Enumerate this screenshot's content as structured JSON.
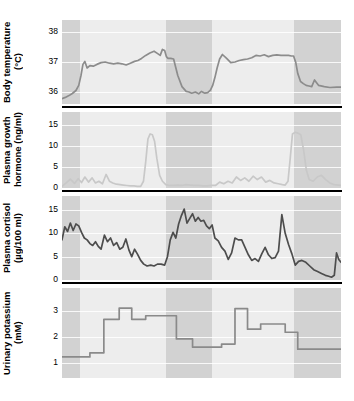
{
  "figure": {
    "top_annotations": [
      {
        "label": "Lights on",
        "x_frac": 0.13
      },
      {
        "label": "Lights off",
        "x_frac": 0.385
      }
    ]
  },
  "chart_data": [
    {
      "type": "line",
      "title": "Body temperature",
      "ylabel": "Body temperature (°C)",
      "units": "°C",
      "xlabel": "",
      "ylim": [
        35.6,
        38.4
      ],
      "yticks": [
        38,
        37,
        36
      ],
      "grid": true,
      "line_color": "#8c8c8c",
      "shaded_bands": [
        {
          "label": "dark",
          "x0": 0.0,
          "x1": 0.065
        },
        {
          "label": "light",
          "x0": 0.065,
          "x1": 0.372
        },
        {
          "label": "dark",
          "x0": 0.372,
          "x1": 0.537
        },
        {
          "label": "light",
          "x0": 0.537,
          "x1": 0.83
        },
        {
          "label": "dark",
          "x0": 0.83,
          "x1": 1.0
        }
      ],
      "x": [
        0.0,
        0.012,
        0.025,
        0.037,
        0.05,
        0.06,
        0.068,
        0.075,
        0.082,
        0.09,
        0.1,
        0.112,
        0.125,
        0.14,
        0.155,
        0.17,
        0.185,
        0.2,
        0.215,
        0.23,
        0.245,
        0.26,
        0.272,
        0.285,
        0.3,
        0.315,
        0.33,
        0.343,
        0.352,
        0.36,
        0.368,
        0.374,
        0.38,
        0.39,
        0.4,
        0.415,
        0.43,
        0.445,
        0.455,
        0.465,
        0.478,
        0.49,
        0.5,
        0.512,
        0.522,
        0.532,
        0.54,
        0.548,
        0.556,
        0.565,
        0.575,
        0.59,
        0.605,
        0.62,
        0.635,
        0.65,
        0.665,
        0.68,
        0.695,
        0.71,
        0.725,
        0.74,
        0.755,
        0.77,
        0.785,
        0.8,
        0.812,
        0.822,
        0.83,
        0.838,
        0.845,
        0.855,
        0.865,
        0.875,
        0.885,
        0.895,
        0.905,
        0.92,
        0.94,
        0.96,
        0.985,
        1.0
      ],
      "y": [
        35.78,
        35.82,
        35.88,
        35.95,
        36.05,
        36.22,
        36.55,
        36.92,
        37.02,
        36.8,
        36.88,
        36.86,
        36.92,
        36.98,
        37.0,
        36.96,
        36.94,
        36.96,
        36.94,
        36.9,
        36.96,
        37.02,
        37.05,
        37.12,
        37.22,
        37.3,
        37.36,
        37.28,
        37.22,
        37.42,
        37.38,
        37.18,
        37.12,
        37.12,
        37.1,
        36.55,
        36.18,
        36.02,
        36.0,
        35.96,
        36.0,
        35.94,
        36.02,
        35.96,
        35.98,
        36.06,
        36.22,
        36.48,
        36.8,
        37.1,
        37.25,
        37.12,
        36.98,
        37.0,
        37.05,
        37.08,
        37.1,
        37.14,
        37.22,
        37.2,
        37.24,
        37.18,
        37.22,
        37.24,
        37.22,
        37.22,
        37.22,
        37.2,
        37.2,
        36.98,
        36.62,
        36.35,
        36.28,
        36.22,
        36.2,
        36.18,
        36.4,
        36.22,
        36.18,
        36.15,
        36.16,
        36.16
      ]
    },
    {
      "type": "line",
      "title": "Plasma growth hormone",
      "ylabel": "Plasma growth hormone (ng/ml)",
      "units": "ng/ml",
      "xlabel": "",
      "ylim": [
        0,
        18
      ],
      "yticks": [
        15,
        10,
        5,
        0
      ],
      "grid": true,
      "line_color": "#c8c8c8",
      "shaded_bands": [
        {
          "label": "dark",
          "x0": 0.0,
          "x1": 0.065
        },
        {
          "label": "light",
          "x0": 0.065,
          "x1": 0.372
        },
        {
          "label": "dark",
          "x0": 0.372,
          "x1": 0.537
        },
        {
          "label": "light",
          "x0": 0.537,
          "x1": 0.83
        },
        {
          "label": "dark",
          "x0": 0.83,
          "x1": 1.0
        }
      ],
      "x": [
        0.0,
        0.015,
        0.03,
        0.045,
        0.058,
        0.07,
        0.082,
        0.095,
        0.108,
        0.12,
        0.132,
        0.145,
        0.158,
        0.17,
        0.182,
        0.195,
        0.208,
        0.22,
        0.232,
        0.245,
        0.258,
        0.27,
        0.282,
        0.292,
        0.3,
        0.308,
        0.316,
        0.324,
        0.332,
        0.34,
        0.35,
        0.36,
        0.372,
        0.385,
        0.4,
        0.415,
        0.43,
        0.445,
        0.46,
        0.475,
        0.49,
        0.505,
        0.52,
        0.535,
        0.55,
        0.565,
        0.58,
        0.595,
        0.61,
        0.625,
        0.64,
        0.655,
        0.67,
        0.685,
        0.7,
        0.715,
        0.73,
        0.745,
        0.76,
        0.775,
        0.79,
        0.8,
        0.81,
        0.818,
        0.826,
        0.836,
        0.846,
        0.856,
        0.866,
        0.876,
        0.886,
        0.9,
        0.915,
        0.93,
        0.945,
        0.96,
        0.975,
        1.0
      ],
      "y": [
        0.4,
        1.2,
        2.1,
        1.1,
        2.2,
        1.3,
        2.6,
        1.4,
        2.4,
        1.2,
        1.6,
        1.0,
        3.2,
        1.6,
        1.2,
        0.9,
        0.8,
        0.7,
        0.6,
        0.5,
        0.5,
        0.4,
        0.4,
        1.6,
        6.2,
        11.6,
        12.8,
        12.6,
        11.0,
        7.0,
        3.0,
        1.6,
        0.8,
        0.6,
        0.6,
        0.7,
        0.6,
        0.8,
        0.7,
        0.6,
        0.6,
        0.5,
        0.5,
        0.6,
        0.6,
        1.4,
        1.0,
        1.6,
        1.2,
        2.6,
        1.8,
        2.4,
        1.6,
        2.8,
        2.0,
        2.6,
        1.4,
        1.8,
        1.2,
        1.0,
        0.8,
        0.7,
        1.6,
        7.0,
        12.8,
        13.2,
        13.0,
        12.6,
        9.0,
        4.2,
        2.0,
        1.6,
        2.6,
        3.0,
        2.0,
        1.2,
        0.8,
        0.6
      ]
    },
    {
      "type": "line",
      "title": "Plasma cortisol",
      "ylabel": "Plasma cortisol (µg/100 ml)",
      "units": "µg/100 ml",
      "xlabel": "",
      "ylim": [
        0,
        18
      ],
      "yticks": [
        15,
        10,
        5,
        0
      ],
      "grid": true,
      "line_color": "#4d4d4d",
      "shaded_bands": [
        {
          "label": "dark",
          "x0": 0.0,
          "x1": 0.065
        },
        {
          "label": "light",
          "x0": 0.065,
          "x1": 0.372
        },
        {
          "label": "dark",
          "x0": 0.372,
          "x1": 0.537
        },
        {
          "label": "light",
          "x0": 0.537,
          "x1": 0.83
        },
        {
          "label": "dark",
          "x0": 0.83,
          "x1": 1.0
        }
      ],
      "x": [
        0.0,
        0.01,
        0.02,
        0.03,
        0.04,
        0.05,
        0.06,
        0.07,
        0.08,
        0.09,
        0.1,
        0.11,
        0.12,
        0.13,
        0.14,
        0.152,
        0.163,
        0.174,
        0.185,
        0.196,
        0.207,
        0.218,
        0.229,
        0.24,
        0.25,
        0.26,
        0.27,
        0.282,
        0.293,
        0.305,
        0.318,
        0.33,
        0.342,
        0.355,
        0.368,
        0.378,
        0.388,
        0.398,
        0.408,
        0.418,
        0.428,
        0.438,
        0.448,
        0.458,
        0.468,
        0.478,
        0.488,
        0.498,
        0.508,
        0.518,
        0.528,
        0.538,
        0.548,
        0.56,
        0.572,
        0.584,
        0.596,
        0.608,
        0.62,
        0.632,
        0.644,
        0.656,
        0.668,
        0.68,
        0.692,
        0.704,
        0.716,
        0.728,
        0.74,
        0.752,
        0.764,
        0.776,
        0.788,
        0.8,
        0.812,
        0.824,
        0.836,
        0.848,
        0.86,
        0.874,
        0.888,
        0.902,
        0.916,
        0.93,
        0.944,
        0.956,
        0.966,
        0.976,
        0.984,
        0.992,
        1.0
      ],
      "y": [
        8.6,
        11.4,
        10.4,
        12.2,
        10.6,
        12.0,
        11.6,
        10.2,
        9.0,
        8.6,
        7.8,
        7.4,
        8.2,
        7.2,
        6.6,
        9.6,
        8.2,
        9.0,
        7.4,
        8.0,
        6.6,
        7.0,
        8.8,
        6.4,
        5.0,
        6.6,
        5.6,
        4.2,
        3.4,
        3.0,
        3.2,
        3.0,
        3.4,
        3.4,
        3.2,
        5.0,
        8.6,
        10.2,
        9.0,
        12.0,
        13.8,
        15.2,
        12.2,
        13.2,
        14.2,
        12.6,
        13.4,
        12.6,
        12.8,
        11.6,
        11.0,
        11.8,
        9.0,
        8.4,
        7.0,
        6.2,
        4.4,
        5.8,
        9.0,
        8.6,
        8.6,
        7.0,
        5.4,
        4.2,
        4.6,
        4.0,
        5.6,
        7.0,
        5.4,
        4.6,
        4.8,
        6.2,
        14.0,
        10.0,
        7.6,
        5.6,
        3.2,
        4.0,
        4.2,
        3.8,
        3.0,
        2.2,
        1.8,
        1.4,
        1.0,
        0.8,
        0.6,
        1.0,
        5.8,
        4.4,
        3.8
      ]
    },
    {
      "type": "step",
      "title": "Urinary potassium",
      "ylabel": "Urinary potassium (mM)",
      "units": "mM",
      "xlabel": "",
      "ylim": [
        0.4,
        3.9
      ],
      "yticks": [
        3,
        2,
        1
      ],
      "grid": true,
      "line_color": "#8a8a8a",
      "shaded_bands": [
        {
          "label": "dark",
          "x0": 0.0,
          "x1": 0.065
        },
        {
          "label": "light",
          "x0": 0.065,
          "x1": 0.372
        },
        {
          "label": "dark",
          "x0": 0.372,
          "x1": 0.537
        },
        {
          "label": "light",
          "x0": 0.537,
          "x1": 0.83
        },
        {
          "label": "dark",
          "x0": 0.83,
          "x1": 1.0
        }
      ],
      "step_edges": [
        0.0,
        0.05,
        0.1,
        0.15,
        0.205,
        0.25,
        0.3,
        0.35,
        0.41,
        0.468,
        0.53,
        0.572,
        0.62,
        0.665,
        0.712,
        0.76,
        0.8,
        0.845,
        1.0
      ],
      "step_values": [
        1.22,
        1.22,
        1.38,
        2.68,
        3.12,
        2.68,
        2.82,
        2.82,
        1.92,
        1.6,
        1.6,
        1.72,
        3.1,
        2.3,
        2.5,
        2.5,
        2.18,
        1.52,
        1.52
      ]
    }
  ]
}
